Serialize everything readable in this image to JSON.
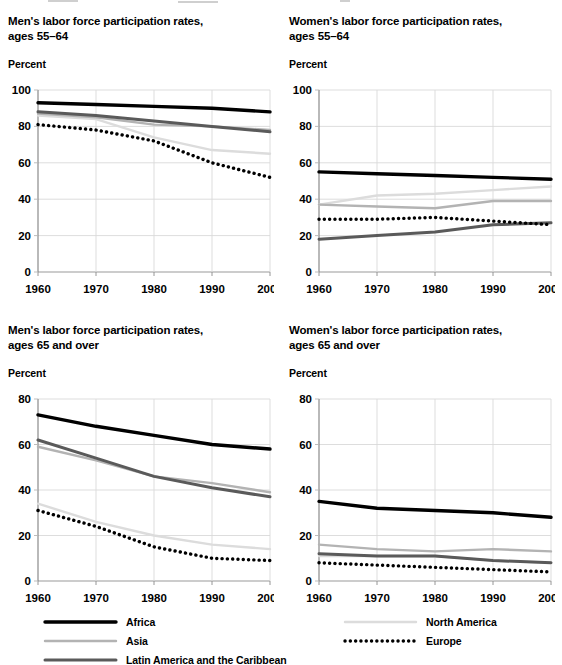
{
  "figure": {
    "background": "#ffffff",
    "width": 562,
    "height": 665
  },
  "panels": [
    {
      "id": "men-55-64",
      "title": "Men's labor force participation rates,\nages 55–64",
      "title_line1": "Men's labor force participation rates,",
      "title_line2": "ages 55–64",
      "unit_label": "Percent"
    },
    {
      "id": "women-55-64",
      "title_line1": "Women's labor force participation rates,",
      "title_line2": "ages 55–64",
      "unit_label": "Percent"
    },
    {
      "id": "men-65-over",
      "title_line1": "Men's labor force participation rates,",
      "title_line2": "ages 65 and over",
      "unit_label": "Percent"
    },
    {
      "id": "women-65-over",
      "title_line1": "Women's labor force participation rates,",
      "title_line2": "ages 65 and over",
      "unit_label": "Percent"
    }
  ],
  "legend": {
    "position": "bottom",
    "left_column": [
      {
        "label": "Africa",
        "color": "#000000",
        "style": "solid",
        "width": 3.4
      },
      {
        "label": "Asia",
        "color": "#b3b3b3",
        "style": "solid",
        "width": 2.4
      },
      {
        "label": "Latin America and the Caribbean",
        "color": "#5a5a5a",
        "style": "solid",
        "width": 3.0
      }
    ],
    "right_column": [
      {
        "label": "North America",
        "color": "#dcdcdc",
        "style": "solid",
        "width": 2.4
      },
      {
        "label": "Europe",
        "color": "#000000",
        "style": "dotted",
        "width": 3.0
      }
    ]
  },
  "series_colors": {
    "Africa": "#000000",
    "Asia": "#b3b3b3",
    "Latin America and the Caribbean": "#5a5a5a",
    "North America": "#dcdcdc",
    "Europe": "#000000"
  },
  "chart_data": [
    {
      "type": "line",
      "title": "Men's labor force participation rates, ages 55–64",
      "xlabel": "",
      "ylabel": "Percent",
      "x": [
        1960,
        1970,
        1980,
        1990,
        2000
      ],
      "xticks": [
        "1960",
        "1970",
        "1980",
        "1990",
        "2000"
      ],
      "yticks": [
        0,
        20,
        40,
        60,
        80,
        100
      ],
      "ylim": [
        0,
        100
      ],
      "xlim": [
        1960,
        2000
      ],
      "grid": true,
      "legend": "bottom",
      "series": [
        {
          "name": "Africa",
          "values": [
            93,
            92,
            91,
            90,
            88
          ]
        },
        {
          "name": "Asia",
          "values": [
            87,
            85,
            81,
            80,
            78
          ]
        },
        {
          "name": "Latin America and the Caribbean",
          "values": [
            88,
            86,
            83,
            80,
            77
          ]
        },
        {
          "name": "North America",
          "values": [
            86,
            84,
            74,
            67,
            65
          ]
        },
        {
          "name": "Europe",
          "values": [
            81,
            78,
            72,
            60,
            52
          ]
        }
      ]
    },
    {
      "type": "line",
      "title": "Women's labor force participation rates, ages 55–64",
      "xlabel": "",
      "ylabel": "Percent",
      "x": [
        1960,
        1970,
        1980,
        1990,
        2000
      ],
      "xticks": [
        "1960",
        "1970",
        "1980",
        "1990",
        "2000"
      ],
      "yticks": [
        0,
        20,
        40,
        60,
        80,
        100
      ],
      "ylim": [
        0,
        100
      ],
      "xlim": [
        1960,
        2000
      ],
      "grid": true,
      "legend": "bottom",
      "series": [
        {
          "name": "Africa",
          "values": [
            55,
            54,
            53,
            52,
            51
          ]
        },
        {
          "name": "Asia",
          "values": [
            37,
            36,
            35,
            39,
            39
          ]
        },
        {
          "name": "Latin America and the Caribbean",
          "values": [
            18,
            20,
            22,
            26,
            27
          ]
        },
        {
          "name": "North America",
          "values": [
            37,
            42,
            43,
            45,
            47
          ]
        },
        {
          "name": "Europe",
          "values": [
            29,
            29,
            30,
            28,
            26
          ]
        }
      ]
    },
    {
      "type": "line",
      "title": "Men's labor force participation rates, ages 65 and over",
      "xlabel": "",
      "ylabel": "Percent",
      "x": [
        1960,
        1970,
        1980,
        1990,
        2000
      ],
      "xticks": [
        "1960",
        "1970",
        "1980",
        "1990",
        "2000"
      ],
      "yticks": [
        0,
        20,
        40,
        60,
        80
      ],
      "ylim": [
        0,
        80
      ],
      "xlim": [
        1960,
        2000
      ],
      "grid": true,
      "legend": "bottom",
      "series": [
        {
          "name": "Africa",
          "values": [
            73,
            68,
            64,
            60,
            58
          ]
        },
        {
          "name": "Asia",
          "values": [
            59,
            53,
            46,
            43,
            39
          ]
        },
        {
          "name": "Latin America and the Caribbean",
          "values": [
            62,
            54,
            46,
            41,
            37
          ]
        },
        {
          "name": "North America",
          "values": [
            34,
            26,
            20,
            16,
            14
          ]
        },
        {
          "name": "Europe",
          "values": [
            31,
            24,
            15,
            10,
            9
          ]
        }
      ]
    },
    {
      "type": "line",
      "title": "Women's labor force participation rates, ages 65 and over",
      "xlabel": "",
      "ylabel": "Percent",
      "x": [
        1960,
        1970,
        1980,
        1990,
        2000
      ],
      "xticks": [
        "1960",
        "1970",
        "1980",
        "1990",
        "2000"
      ],
      "yticks": [
        0,
        20,
        40,
        60,
        80
      ],
      "ylim": [
        0,
        80
      ],
      "xlim": [
        1960,
        2000
      ],
      "grid": true,
      "legend": "bottom",
      "series": [
        {
          "name": "Africa",
          "values": [
            35,
            32,
            31,
            30,
            28
          ]
        },
        {
          "name": "Asia",
          "values": [
            16,
            14,
            13,
            14,
            13
          ]
        },
        {
          "name": "Latin America and the Caribbean",
          "values": [
            12,
            11,
            11,
            9,
            8
          ]
        },
        {
          "name": "North America",
          "values": [
            11,
            11,
            11,
            9,
            8
          ]
        },
        {
          "name": "Europe",
          "values": [
            8,
            7,
            6,
            5,
            4
          ]
        }
      ]
    }
  ]
}
